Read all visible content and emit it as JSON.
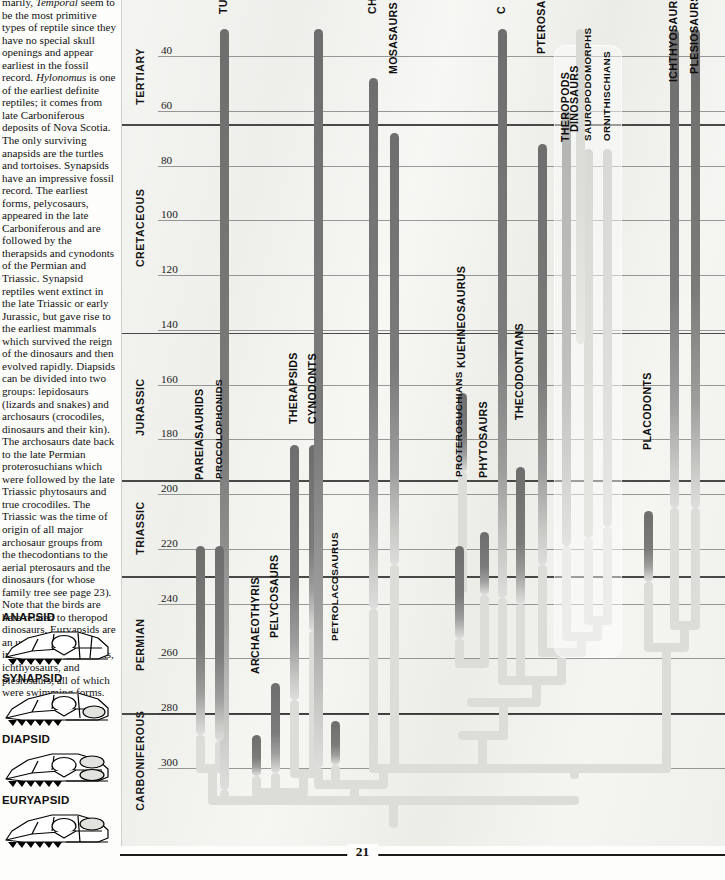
{
  "page": {
    "number": "21"
  },
  "article": {
    "paragraph_html": "marily, <i>Temporal</i> seem to be the most primitive types of reptile since they have no special skull openings and appear earliest in the fossil record. <i>Hylonomus</i> is one of the earliest definite reptiles; it comes from late Carboniferous deposits of Nova Scotia. The only surviving anapsids are the turtles and tortoises. Synapsids have an impressive fossil record. The earliest forms, pelycosaurs, appeared in the late Carboniferous and are followed by the therapsids and cynodonts of the Permian and Triassic. Synapsid reptiles went extinct in the late Triassic or early Jurassic, but gave rise to the earliest mammals which survived the reign of the dinosaurs and then evolved rapidly. Diapsids can be divided into two groups: lepidosaurs (lizards and snakes) and archosaurs (crocodiles, dinosaurs and their kin). The archosaurs date back to the late Permian proterosuchians which were followed by the late Triassic phytosaurs and true crocodiles. The Triassic was the time of origin of all major archosaur groups from the thecodontians to the aerial pterosaurs and the dinosaurs (for whose family tree see page 23). Note that the birds are here related to theropod dinosaurs. Euryapsids are an uncertain group including the placodonts, ichthyosaurs, and plesiosaurs, all of which were swimming forms."
  },
  "skull_diagrams": [
    {
      "label": "ANAPSID",
      "top": 611
    },
    {
      "label": "SYNAPSID",
      "top": 672
    },
    {
      "label": "DIAPSID",
      "top": 733
    },
    {
      "label": "EURYAPSID",
      "top": 794
    }
  ],
  "chart_data": {
    "type": "timeline",
    "ylabel": "Millions of years ago",
    "yaxis_direction": "inverted",
    "ylim": [
      30,
      315
    ],
    "tick_values": [
      40,
      60,
      80,
      100,
      120,
      140,
      160,
      180,
      200,
      220,
      240,
      260,
      280,
      300
    ],
    "tick_labels": [
      "40",
      "60",
      "80",
      "100",
      "120",
      "140",
      "160",
      "180",
      "200",
      "220",
      "240",
      "260",
      "280",
      "300"
    ],
    "grid": true,
    "periods": [
      {
        "name": "TERTIARY",
        "start": 30,
        "end": 65
      },
      {
        "name": "CRETACEOUS",
        "start": 65,
        "end": 141
      },
      {
        "name": "JURASSIC",
        "start": 141,
        "end": 195
      },
      {
        "name": "TRIASSIC",
        "start": 195,
        "end": 230
      },
      {
        "name": "PERMIAN",
        "start": 230,
        "end": 280
      },
      {
        "name": "CARBONIFEROUS",
        "start": 280,
        "end": 315
      }
    ],
    "period_boundaries": [
      65,
      141,
      195,
      230,
      280
    ],
    "taxa": [
      {
        "name": "TURTLES AND TORTOISES",
        "label": "TURTLES AND",
        "x": 224,
        "top_my": 30,
        "bottom_my": 308,
        "weight": "dark",
        "label_y": 0
      },
      {
        "name": "PAREIASAURIDS",
        "label": "PAREIASAURIDS",
        "x": 200,
        "top_my": 219,
        "bottom_my": 288,
        "weight": "dark",
        "label_y": 466
      },
      {
        "name": "PROCOLOPHONIDS",
        "label": "PROCOLOPHONIDS",
        "x": 219,
        "top_my": 219,
        "bottom_my": 290,
        "weight": "dark",
        "label_y": 466
      },
      {
        "name": "ARCHAEOTHYRIS",
        "label": "ARCHAEOTHYRIS",
        "x": 256,
        "top_my": 288,
        "bottom_my": 303,
        "weight": "dark",
        "label_y": 660
      },
      {
        "name": "PELYCOSAURS",
        "label": "PELYCOSAURS",
        "x": 275,
        "top_my": 269,
        "bottom_my": 302,
        "weight": "dark",
        "label_y": 624
      },
      {
        "name": "THERAPSIDS",
        "label": "THERAPSIDS",
        "x": 294,
        "top_my": 182,
        "bottom_my": 275,
        "weight": "dark",
        "label_y": 410
      },
      {
        "name": "CYNODONTS",
        "label": "CYNODONTS",
        "x": 313,
        "top_my": 182,
        "bottom_my": 250,
        "weight": "dark",
        "label_y": 410
      },
      {
        "name": "PETROLACOSAURUS",
        "label": "PETROLACOSAURUS",
        "x": 335,
        "top_my": 283,
        "bottom_my": 299,
        "weight": "dark",
        "label_y": 628
      },
      {
        "name": "LIZARDS AND SNAKES",
        "label": "",
        "x": 318,
        "top_my": 30,
        "bottom_my": 300,
        "weight": "dark",
        "label_y": 0
      },
      {
        "name": "CHAMPSOSAURS",
        "label": "CHAMPSOSAURS",
        "x": 373,
        "top_my": 48,
        "bottom_my": 242,
        "weight": "dark",
        "label_y": 0
      },
      {
        "name": "MOSASAURS",
        "label": "MOSASAURS",
        "x": 394,
        "top_my": 68,
        "bottom_my": 226,
        "weight": "dark",
        "label_y": 60
      },
      {
        "name": "KUEHNEOSAURUS",
        "label": "KUEHNEOSAURUS",
        "x": 462,
        "top_my": 163,
        "bottom_my": 192,
        "weight": "dark",
        "label_y": 354
      },
      {
        "name": "PROTEROSUCHIANS",
        "label": "PROTEROSUCHIANS",
        "x": 459,
        "top_my": 219,
        "bottom_my": 253,
        "weight": "dark",
        "label_y": 464
      },
      {
        "name": "PHYTOSAURS",
        "label": "PHYTOSAURS",
        "x": 484,
        "top_my": 214,
        "bottom_my": 237,
        "weight": "dark",
        "label_y": 464
      },
      {
        "name": "THECODONTIANS",
        "label": "THECODONTIANS",
        "x": 520,
        "top_my": 190,
        "bottom_my": 240,
        "weight": "dark",
        "label_y": 406
      },
      {
        "name": "CROCODILES",
        "label": "C",
        "x": 502,
        "top_my": 30,
        "bottom_my": 238,
        "weight": "dark",
        "label_y": 0
      },
      {
        "name": "PTEROSAURS",
        "label": "PTEROSAURS",
        "x": 542,
        "top_my": 72,
        "bottom_my": 226,
        "weight": "dark",
        "label_y": 40
      },
      {
        "name": "THEROPODS",
        "label": "THEROPODS",
        "x": 566,
        "top_my": 60,
        "bottom_my": 219,
        "weight": "mid",
        "label_y": 128
      },
      {
        "name": "SAUROPODOMORPHS",
        "label": "SAUROPODOMORPHS",
        "x": 588,
        "top_my": 74,
        "bottom_my": 216,
        "weight": "light",
        "label_y": 128
      },
      {
        "name": "ORNITHISCHIANS",
        "label": "ORNITHISCHIANS",
        "x": 607,
        "top_my": 74,
        "bottom_my": 212,
        "weight": "light",
        "label_y": 128
      },
      {
        "name": "BIRDS",
        "label": "",
        "x": 580,
        "top_my": 30,
        "bottom_my": 145,
        "weight": "light",
        "label_y": 0
      },
      {
        "name": "PLACODONTS",
        "label": "PLACODONTS",
        "x": 648,
        "top_my": 206,
        "bottom_my": 232,
        "weight": "dark",
        "label_y": 436
      },
      {
        "name": "ICHTHYOSAURS",
        "label": "ICHTHYOSAURS",
        "x": 674,
        "top_my": 30,
        "bottom_my": 205,
        "weight": "dark",
        "label_y": 68
      },
      {
        "name": "PLESIOSAURS",
        "label": "PLESIOSAURS",
        "x": 695,
        "top_my": 30,
        "bottom_my": 205,
        "weight": "dark",
        "label_y": 60
      }
    ],
    "notes": [
      "Dinosaurs group box encloses Theropods, Sauropodomorphs and Ornithischians.",
      "All lineages converge to a single ancestral stem in the Carboniferous (~310 Ma)."
    ],
    "group_boxes": [
      {
        "label": "DINOSAURS",
        "x": 554,
        "width": 68,
        "top_my": 36,
        "bottom_my": 260
      }
    ]
  }
}
